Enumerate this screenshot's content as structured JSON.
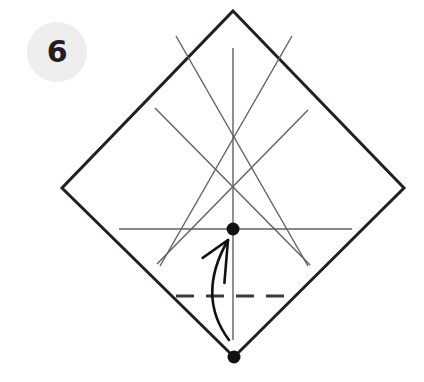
{
  "step": {
    "number": "6",
    "badge_color": "#eeeeee",
    "badge_text_color": "#231f20"
  },
  "colors": {
    "background": "#ffffff",
    "paper_edge": "#231f20",
    "crease_line": "#606060",
    "fold_line_dashed": "#3a3a3a",
    "arrow": "#111111",
    "reference_dot": "#111111"
  },
  "chart_data": {
    "type": "diagram",
    "subtitle": "Square sheet rotated 45 degrees with existing creases; valley-fold the bottom corner up to the center reference point",
    "canvas": {
      "width": 424,
      "height": 382
    },
    "paper": {
      "name": "square-sheet-diamond",
      "stroke_width": 3,
      "vertices": [
        {
          "name": "top",
          "x": 233,
          "y": 11
        },
        {
          "name": "right",
          "x": 404,
          "y": 188
        },
        {
          "name": "bottom",
          "x": 234,
          "y": 357
        },
        {
          "name": "left",
          "x": 62,
          "y": 188
        }
      ]
    },
    "creases": [
      {
        "name": "vertical-center-crease",
        "x1": 233,
        "y1": 48,
        "x2": 233,
        "y2": 340
      },
      {
        "name": "horizontal-crease",
        "x1": 119,
        "y1": 229,
        "x2": 352,
        "y2": 229
      },
      {
        "name": "diagonal-upper-left-to-lower-right",
        "x1": 176,
        "y1": 36,
        "x2": 308,
        "y2": 266
      },
      {
        "name": "diagonal-upper-right-to-lower-left",
        "x1": 292,
        "y1": 36,
        "x2": 160,
        "y2": 266
      },
      {
        "name": "diagonal-left-long-down-right",
        "x1": 155,
        "y1": 108,
        "x2": 310,
        "y2": 265
      },
      {
        "name": "diagonal-right-long-down-left",
        "x1": 308,
        "y1": 110,
        "x2": 157,
        "y2": 264
      }
    ],
    "crossings": [
      {
        "name": "upper-x-crossing",
        "x": 233,
        "y": 94
      },
      {
        "name": "left-x-crossing",
        "x": 193,
        "y": 146
      },
      {
        "name": "right-x-crossing",
        "x": 274,
        "y": 146
      },
      {
        "name": "center-crossing",
        "x": 233,
        "y": 229
      }
    ],
    "fold_line": {
      "name": "valley-fold-dashed-line",
      "style": "dashed",
      "y": 296,
      "x1": 176,
      "x2": 292,
      "dash_pattern": "18 12"
    },
    "reference_points": [
      {
        "name": "center-reference-dot",
        "x": 233,
        "y": 229,
        "radius": 6.5
      },
      {
        "name": "bottom-corner-dot",
        "x": 234,
        "y": 357,
        "radius": 6.5
      }
    ],
    "arrow": {
      "name": "fold-direction-arrow",
      "kind": "curved-valley-fold-arrow",
      "from": {
        "x": 229,
        "y": 340
      },
      "to": {
        "x": 228,
        "y": 240
      },
      "control": {
        "x": 196,
        "y": 296
      },
      "head_angle_deg": 25
    }
  }
}
